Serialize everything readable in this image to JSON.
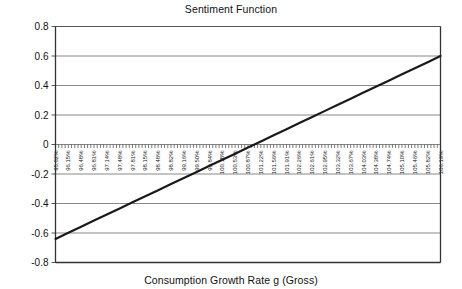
{
  "chart_data": {
    "type": "line",
    "title": "Sentiment Function",
    "xlabel": "Consumption Growth Rate g (Gross)",
    "ylabel": "",
    "ylim": [
      -0.8,
      0.8
    ],
    "ytick_labels": [
      "0.8",
      "0.6",
      "0.4",
      "0.2",
      "0",
      "-0.2",
      "-0.4",
      "-0.6",
      "-0.8"
    ],
    "ytick_values": [
      0.8,
      0.6,
      0.4,
      0.2,
      0,
      -0.2,
      -0.4,
      -0.6,
      -0.8
    ],
    "grid": true,
    "legend": "none",
    "categories": [
      "95.82%",
      "96.15%",
      "96.48%",
      "96.81%",
      "97.14%",
      "97.48%",
      "97.81%",
      "98.15%",
      "98.48%",
      "98.82%",
      "99.16%",
      "99.50%",
      "99.84%",
      "100.18%",
      "100.53%",
      "100.87%",
      "101.22%",
      "101.56%",
      "101.91%",
      "102.26%",
      "102.61%",
      "102.95%",
      "103.32%",
      "103.67%",
      "104.03%",
      "104.38%",
      "104.74%",
      "105.10%",
      "105.46%",
      "105.82%",
      "106.19%"
    ],
    "series": [
      {
        "name": "Sentiment",
        "values": [
          -0.64,
          -0.599,
          -0.558,
          -0.516,
          -0.475,
          -0.434,
          -0.392,
          -0.351,
          -0.31,
          -0.268,
          -0.227,
          -0.186,
          -0.144,
          -0.103,
          -0.062,
          -0.02,
          0.021,
          0.062,
          0.104,
          0.145,
          0.186,
          0.228,
          0.269,
          0.31,
          0.352,
          0.393,
          0.434,
          0.476,
          0.517,
          0.558,
          0.6
        ]
      }
    ]
  },
  "colors": {
    "series_line": "#1a1a1a",
    "gridline": "#888888",
    "axis": "#555555",
    "text": "#111111"
  }
}
